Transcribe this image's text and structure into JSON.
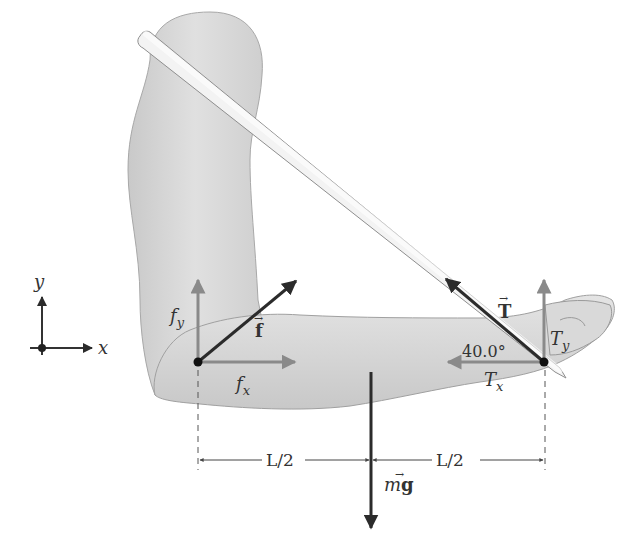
{
  "diagram": {
    "axes": {
      "x_label": "x",
      "y_label": "y"
    },
    "elbow_forces": {
      "f_vector": "f",
      "fx_label": "f",
      "fx_sub": "x",
      "fy_label": "f",
      "fy_sub": "y"
    },
    "tension": {
      "T_vector": "T",
      "Tx_label": "T",
      "Tx_sub": "x",
      "Ty_label": "T",
      "Ty_sub": "y",
      "angle_label": "40.0°"
    },
    "weight": {
      "m": "m",
      "g": "g"
    },
    "dimensions": {
      "left_half": "L/2",
      "right_half": "L/2"
    },
    "colors": {
      "arm_fill": "#d6d6d6",
      "arm_stroke": "#9a9a9a",
      "strap_fill": "#f2f2f2",
      "dark_arrow": "#2b2b2b",
      "component_arrow": "#8a8a8a",
      "text": "#333333"
    }
  }
}
